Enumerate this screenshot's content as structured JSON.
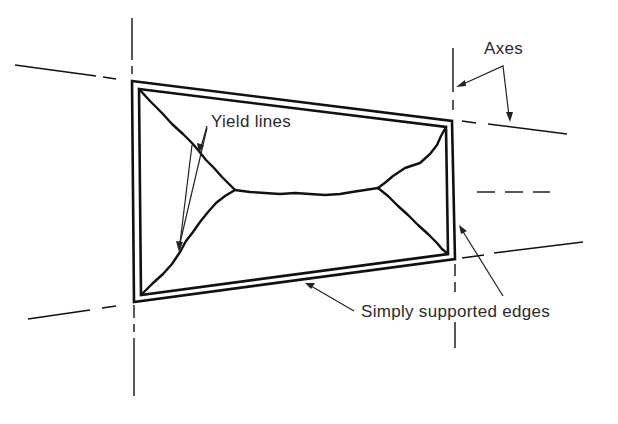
{
  "figure": {
    "type": "yield-line plate diagram",
    "labels": {
      "yield_lines": "Yield lines",
      "axes": "Axes",
      "simply_supported_edges": "Simply supported edges"
    },
    "elements": {
      "plate": "quadrilateral slab with simply supported edges",
      "yield_line_pattern": "envelope pattern: two corner fans joined by a central ridge line",
      "axes": [
        "left vertical axis",
        "right vertical axis",
        "upper inclined axis",
        "lower inclined axis"
      ]
    },
    "colors": {
      "line": "#111111",
      "text": "#2a2a2a",
      "background": "#ffffff"
    }
  }
}
